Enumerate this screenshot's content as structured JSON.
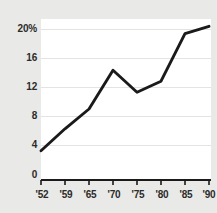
{
  "chart_data": {
    "type": "line",
    "title": "",
    "subtitle": "",
    "xlabel": "",
    "ylabel": "",
    "categories": [
      "'52",
      "'59",
      "'65",
      "'70",
      "'75",
      "'80",
      "'85",
      "'90"
    ],
    "values": [
      4,
      7,
      9.7,
      15,
      12,
      13.5,
      20,
      21
    ],
    "series": [
      {
        "name": "",
        "values": [
          4,
          7,
          9.7,
          15,
          12,
          13.5,
          20,
          21
        ]
      }
    ],
    "x_tick_labels": [
      "'52",
      "'59",
      "'65",
      "'70",
      "'75",
      "'80",
      "'85",
      "'90"
    ],
    "y_tick_labels": [
      "20%",
      "16",
      "12",
      "8",
      "4",
      "0"
    ],
    "y_tick_values": [
      20,
      16,
      12,
      8,
      4,
      0
    ],
    "ylim": [
      0,
      22
    ],
    "grid": true,
    "grid_axis": "y",
    "legend": "none",
    "line_color": "#1a1a1a",
    "plot_background": "#ffffff",
    "figure_background": "#e9e9e7",
    "grid_color": "#e3e3e1",
    "axis_color": "#1a1a1a"
  }
}
